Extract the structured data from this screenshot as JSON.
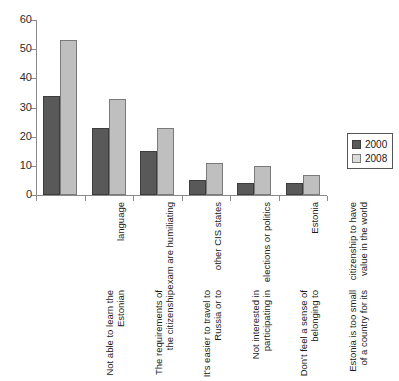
{
  "chart_data": {
    "type": "bar",
    "title": "",
    "title_sliver": "",
    "xlabel": "",
    "ylabel": "",
    "ylim": [
      0,
      60
    ],
    "yticks": [
      0,
      10,
      20,
      30,
      40,
      50,
      60
    ],
    "grid": false,
    "legend_position": "right",
    "categories": [
      "Not able to learn the Estonian language",
      "The requirements of the citizenship exam are humiliating",
      "It's easier to travel to Russia or to other CIS states",
      "Not interested in participating in elections or politics",
      "Don't feel a sense of belonging to Estonia",
      "Estonia is too small of a country for its citizenship to have value in the world"
    ],
    "series": [
      {
        "name": "2000",
        "color": "#595959",
        "values": [
          34,
          23,
          15,
          5,
          4,
          4
        ]
      },
      {
        "name": "2008",
        "color": "#bfbfbf",
        "values": [
          53,
          33,
          23,
          11,
          10,
          7
        ]
      }
    ]
  },
  "axis": {
    "y": {
      "labels": [
        "60",
        "50",
        "40",
        "30",
        "20",
        "10",
        "0"
      ]
    }
  },
  "legend": {
    "items": [
      {
        "label": "2000"
      },
      {
        "label": "2008"
      }
    ]
  },
  "categories_display": [
    [
      "Not able to learn the Estonian",
      "language"
    ],
    [
      "The requirements of the citizenship",
      "exam are humiliating"
    ],
    [
      "It's easier to travel to Russia or to",
      "other CIS states"
    ],
    [
      "Not interested in participating in",
      "elections or politics"
    ],
    [
      "Don't feel a sense of belonging to",
      "Estonia"
    ],
    [
      "Estonia is too small of a country for its",
      "citizenship to have value in the world"
    ]
  ]
}
